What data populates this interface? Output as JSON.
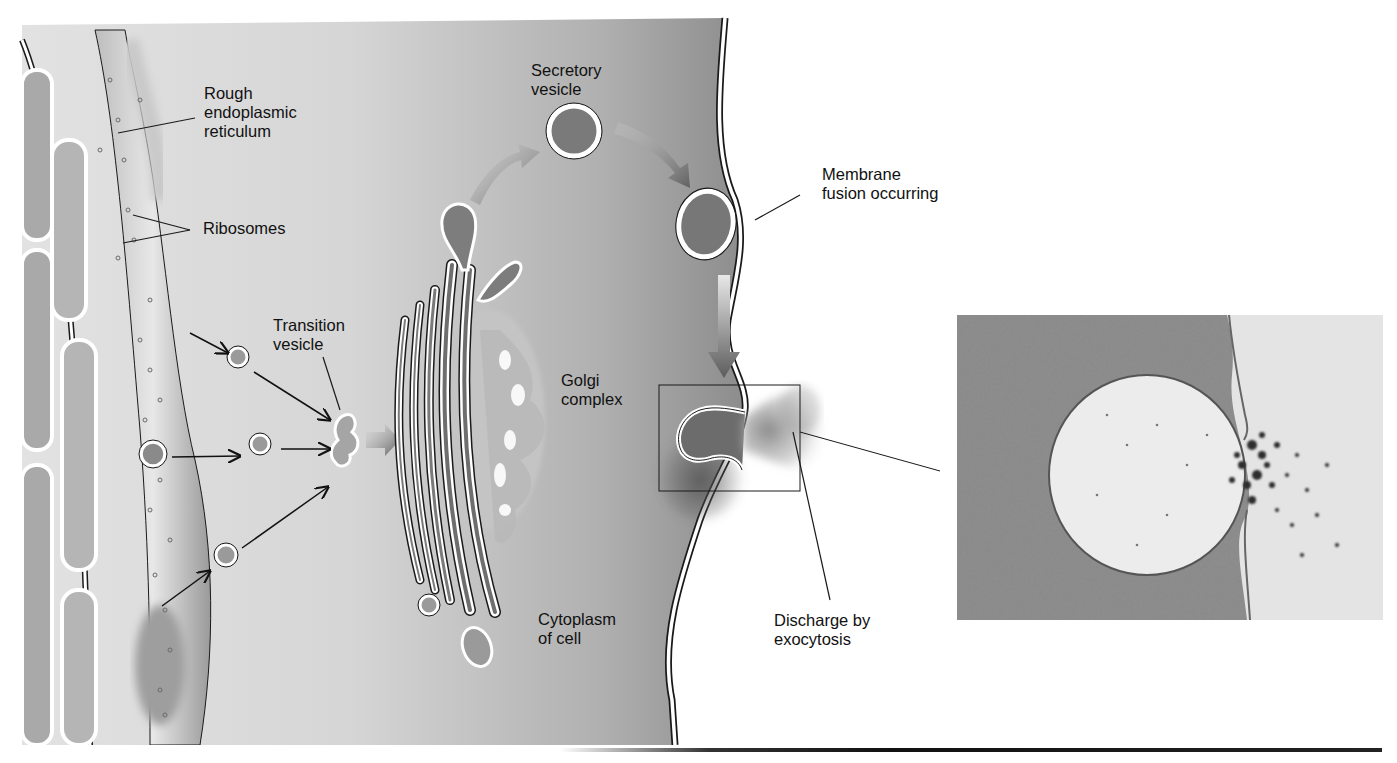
{
  "figure": {
    "colors": {
      "cytoplasm_light": "#d9d9d9",
      "cytoplasm_dark": "#8f8f8f",
      "vesicle_fill": "#7d7d7d",
      "membrane": "#ffffff",
      "outline": "#1a1a1a",
      "background": "#ffffff"
    }
  },
  "labels": {
    "rough_er": [
      "Rough",
      "endoplasmic",
      "reticulum"
    ],
    "ribosomes": [
      "Ribosomes"
    ],
    "transition_vesicle": [
      "Transition",
      "vesicle"
    ],
    "secretory_vesicle": [
      "Secretory",
      "vesicle"
    ],
    "membrane_fusion": [
      "Membrane",
      "fusion occurring"
    ],
    "golgi_complex": [
      "Golgi",
      "complex"
    ],
    "cytoplasm": [
      "Cytoplasm",
      "of cell"
    ],
    "exocytosis": [
      "Discharge by",
      "exocytosis"
    ]
  },
  "micrograph": {
    "description": "Electron micrograph of secretory vesicle fusing with plasma membrane and discharging contents"
  }
}
